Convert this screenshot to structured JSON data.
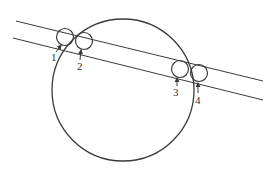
{
  "diagram": {
    "canvas": {
      "width": 279,
      "height": 173,
      "background": "#ffffff"
    },
    "stroke_color": "#3a3a3a",
    "label_color": "#333333",
    "rails": [
      {
        "name": "upper-line",
        "x1": 16,
        "y1": 21,
        "x2": 263,
        "y2": 81
      },
      {
        "name": "lower-line",
        "x1": 13,
        "y1": 38,
        "x2": 263,
        "y2": 100
      }
    ],
    "large_circle": {
      "cx": 123,
      "cy": 90,
      "r": 71
    },
    "small_circles": [
      {
        "id": "1",
        "cx": 65,
        "cy": 37,
        "r": 8.5,
        "label": "1",
        "label_x": 51,
        "label_y": 61,
        "arrow": {
          "x1": 56,
          "y1": 52,
          "x2": 61,
          "y2": 45
        }
      },
      {
        "id": "2",
        "cx": 84,
        "cy": 41,
        "r": 8.5,
        "label": "2",
        "label_x": 77,
        "label_y": 70,
        "arrow": {
          "x1": 80,
          "y1": 60,
          "x2": 81,
          "y2": 50
        }
      },
      {
        "id": "3",
        "cx": 180,
        "cy": 69,
        "r": 8.5,
        "label": "3",
        "label_x": 173,
        "label_y": 96,
        "arrow": {
          "x1": 177,
          "y1": 86,
          "x2": 177,
          "y2": 78
        }
      },
      {
        "id": "4",
        "cx": 199,
        "cy": 73,
        "r": 8.5,
        "label": "4",
        "label_x": 195,
        "label_y": 104,
        "arrow": {
          "x1": 198,
          "y1": 93,
          "x2": 198,
          "y2": 83
        }
      }
    ]
  }
}
